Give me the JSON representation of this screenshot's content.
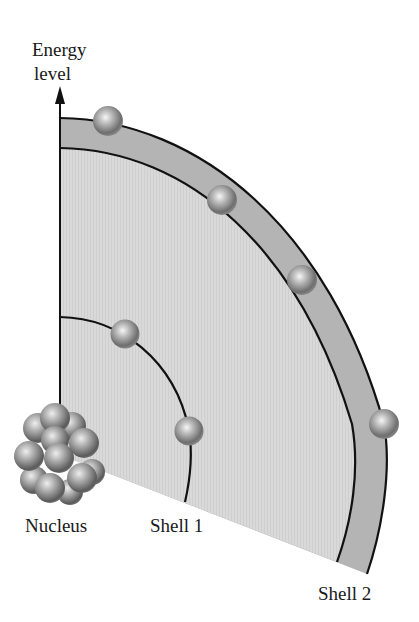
{
  "diagram": {
    "axis_label_line1": "Energy",
    "axis_label_line2": "level",
    "labels": {
      "nucleus": "Nucleus",
      "shell1": "Shell 1",
      "shell2": "Shell 2"
    },
    "shell1_electrons": 2,
    "shell2_electrons": 4,
    "colors": {
      "outer_band": "#b4b4b4",
      "inner_wedge": "#d8d8d8",
      "lines": "#111111"
    }
  }
}
